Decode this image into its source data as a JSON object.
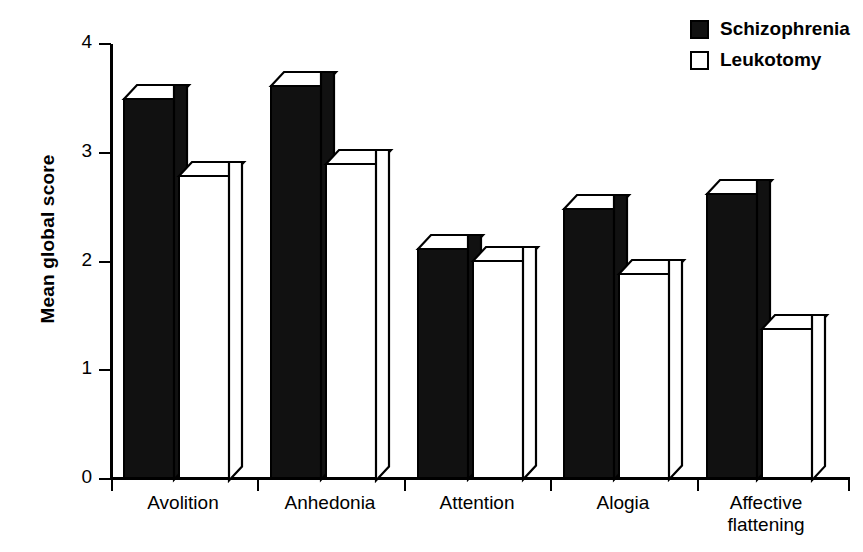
{
  "chart_data": {
    "type": "bar",
    "title": "",
    "xlabel": "",
    "ylabel": "Mean global score",
    "ylim": [
      0,
      4
    ],
    "yticks": [
      "0",
      "1",
      "2",
      "3",
      "4"
    ],
    "grid": false,
    "legend_position": "top-right",
    "style": "3d-block-bars",
    "categories": [
      "Avolition",
      "Anhedonia",
      "Attention",
      "Alogia",
      "Affective flattening"
    ],
    "category_lines": [
      [
        "Avolition"
      ],
      [
        "Anhedonia"
      ],
      [
        "Attention"
      ],
      [
        "Alogia"
      ],
      [
        "Affective",
        "flattening"
      ]
    ],
    "series": [
      {
        "name": "Schizophrenia",
        "swatch": "filled",
        "color": "#111111",
        "values": [
          3.5,
          3.62,
          2.12,
          2.49,
          2.63
        ]
      },
      {
        "name": "Leukotomy",
        "swatch": "hollow",
        "color": "#ffffff",
        "values": [
          2.8,
          2.91,
          2.01,
          1.89,
          1.39
        ]
      }
    ]
  },
  "axis": {
    "y_title": "Mean global score",
    "y_tick_labels": [
      "4",
      "3",
      "2",
      "1",
      "0"
    ]
  },
  "legend": {
    "items": [
      {
        "label": "Schizophrenia",
        "swatch": "filled"
      },
      {
        "label": "Leukotomy",
        "swatch": "hollow"
      }
    ]
  }
}
